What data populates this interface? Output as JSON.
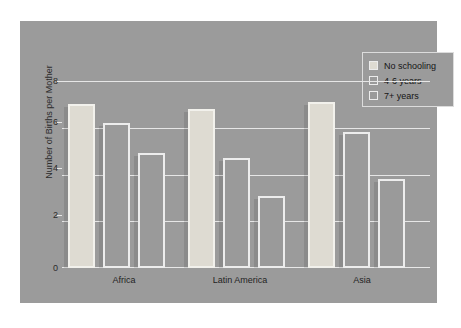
{
  "chart_data": {
    "type": "bar",
    "title": "",
    "xlabel": "",
    "ylabel": "Number of Births per Mother",
    "categories": [
      "Africa",
      "Latin America",
      "Asia"
    ],
    "series": [
      {
        "name": "No schooling",
        "values": [
          7.0,
          6.8,
          7.1
        ],
        "color": "#dedbd2"
      },
      {
        "name": "4-6 years",
        "values": [
          6.2,
          4.7,
          5.8
        ],
        "color": "#9a9a9a"
      },
      {
        "name": "7+ years",
        "values": [
          4.9,
          3.1,
          3.8
        ],
        "color": "#9a9a9a"
      }
    ],
    "ylim": [
      0,
      8
    ],
    "yticks": [
      0,
      2,
      4,
      6,
      8
    ],
    "ytick_labels": [
      "0",
      "2",
      "4",
      "6",
      "8"
    ],
    "grid": true,
    "legend_position": "top-right",
    "legend_entries": [
      "No schooling",
      "4-6 years",
      "7+ years"
    ],
    "background_color": "#9b9b9b",
    "gridline_color": "#e6e6e6",
    "text_color": "#1f1f1f"
  },
  "axis": {
    "y_title": "Number of Births per Mother",
    "tick_0": "0",
    "tick_2": "2",
    "tick_4": "4",
    "tick_6": "6",
    "tick_8": "8"
  },
  "categories": {
    "c0": "Africa",
    "c1": "Latin America",
    "c2": "Asia"
  },
  "legend": {
    "item0": "No schooling",
    "item1": "4-6 years",
    "item2": "7+ years"
  }
}
